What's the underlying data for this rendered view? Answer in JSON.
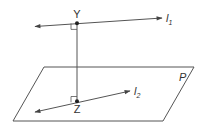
{
  "diagram": {
    "labels": {
      "point_top": "Y",
      "point_bottom": "Z",
      "line_top_letter": "l",
      "line_top_sub": "1",
      "line_bottom_letter": "l",
      "line_bottom_sub": "2",
      "plane": "P"
    },
    "elements": [
      {
        "type": "plane",
        "name": "P"
      },
      {
        "type": "line",
        "name": "l1",
        "passes_through": "Y",
        "arrows": "both"
      },
      {
        "type": "line",
        "name": "l2",
        "passes_through": "Z",
        "lies_in": "P",
        "arrows": "both"
      },
      {
        "type": "segment",
        "name": "YZ",
        "perpendicular_to": [
          "l1",
          "l2"
        ]
      },
      {
        "type": "point",
        "name": "Y"
      },
      {
        "type": "point",
        "name": "Z"
      },
      {
        "type": "right-angle-mark",
        "at": "Y"
      },
      {
        "type": "right-angle-mark",
        "at": "Z"
      }
    ],
    "colors": {
      "stroke": "#555555",
      "point": "#222222",
      "text": "#333333",
      "background": "#ffffff"
    }
  }
}
